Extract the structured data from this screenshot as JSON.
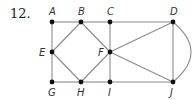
{
  "problem": {
    "number": "12."
  },
  "colors": {
    "edge": "#8a8a8a",
    "vertex": "#111111",
    "label": "#333333"
  },
  "vertices": [
    {
      "id": "A",
      "label": "A",
      "x": 52,
      "y": 22,
      "lx": 49,
      "ly": 15
    },
    {
      "id": "B",
      "label": "B",
      "x": 81,
      "y": 22,
      "lx": 78,
      "ly": 15
    },
    {
      "id": "C",
      "label": "C",
      "x": 110,
      "y": 22,
      "lx": 107,
      "ly": 15
    },
    {
      "id": "D",
      "label": "D",
      "x": 173,
      "y": 22,
      "lx": 170,
      "ly": 15
    },
    {
      "id": "E",
      "label": "E",
      "x": 52,
      "y": 52,
      "lx": 39,
      "ly": 56
    },
    {
      "id": "F",
      "label": "F",
      "x": 110,
      "y": 52,
      "lx": 98,
      "ly": 56
    },
    {
      "id": "G",
      "label": "G",
      "x": 52,
      "y": 82,
      "lx": 48,
      "ly": 96
    },
    {
      "id": "H",
      "label": "H",
      "x": 81,
      "y": 82,
      "lx": 77,
      "ly": 96
    },
    {
      "id": "I",
      "label": "I",
      "x": 110,
      "y": 82,
      "lx": 108,
      "ly": 96
    },
    {
      "id": "J",
      "label": "J",
      "x": 173,
      "y": 82,
      "lx": 170,
      "ly": 96
    }
  ],
  "edges": [
    [
      "A",
      "B"
    ],
    [
      "B",
      "C"
    ],
    [
      "C",
      "D"
    ],
    [
      "G",
      "H"
    ],
    [
      "H",
      "I"
    ],
    [
      "I",
      "J"
    ],
    [
      "A",
      "E"
    ],
    [
      "E",
      "G"
    ],
    [
      "C",
      "F"
    ],
    [
      "F",
      "I"
    ],
    [
      "E",
      "B"
    ],
    [
      "E",
      "H"
    ],
    [
      "B",
      "F"
    ],
    [
      "H",
      "F"
    ],
    [
      "F",
      "D"
    ],
    [
      "F",
      "J"
    ],
    [
      "D",
      "J"
    ]
  ],
  "curved_edges": [
    {
      "from": "D",
      "to": "J",
      "bulge": 18
    }
  ]
}
